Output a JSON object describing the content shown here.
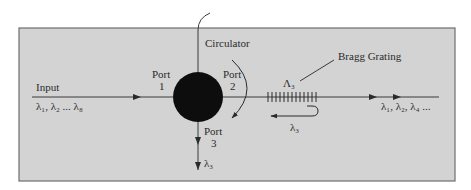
{
  "colors": {
    "panel_fill": "#d3d3d3",
    "panel_border": "#6e6e6e",
    "line": "#3a3a3a",
    "circulator": "#0d0d0d",
    "text": "#2a2a2a"
  },
  "labels": {
    "input": "Input",
    "input_wavelengths": "λ₁, λ₂ ... λ₈",
    "circulator": "Circulator",
    "port1_word": "Port",
    "port1_num": "1",
    "port2_word": "Port",
    "port2_num": "2",
    "port3_word": "Port",
    "port3_num": "3",
    "bragg_grating": "Bragg Grating",
    "grating_period": "Λ₃",
    "reflected_wavelength": "λ₃",
    "dropped_wavelength": "λ₃",
    "output_wavelengths": "λ₁, λ₂, λ₄ ..."
  }
}
